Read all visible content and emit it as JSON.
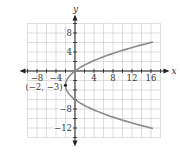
{
  "chart_data": {
    "type": "line",
    "title": "",
    "xlabel": "x",
    "ylabel": "y",
    "xlim": [
      -10,
      18
    ],
    "ylim": [
      -14,
      10
    ],
    "grid": true,
    "x_ticks": [
      -8,
      -4,
      4,
      8,
      12,
      16
    ],
    "y_ticks": [
      8,
      4,
      -8,
      -12
    ],
    "x_tick_labels": [
      "−8",
      "−4",
      "4",
      "8",
      "12",
      "16"
    ],
    "y_tick_labels": [
      "8",
      "4",
      "−8",
      "−12"
    ],
    "series": [
      {
        "name": "parabola x = (2/9)(y+3)^2 - 2",
        "equation": "x = (2/9)(y + 3)^2 - 2",
        "color": "#888888",
        "points": [
          [
            -2,
            -3
          ],
          [
            0,
            0
          ],
          [
            0,
            -6
          ],
          [
            4.22,
            1.8
          ],
          [
            8,
            3.7
          ],
          [
            12,
            4.9
          ],
          [
            16,
            6
          ],
          [
            18,
            6.5
          ],
          [
            16,
            -12
          ],
          [
            12,
            -10.9
          ],
          [
            8,
            -9.7
          ],
          [
            4.22,
            -8.3
          ]
        ]
      }
    ],
    "annotations": [
      {
        "label": "(−2, −3)",
        "x": -2,
        "y": -3
      }
    ]
  }
}
